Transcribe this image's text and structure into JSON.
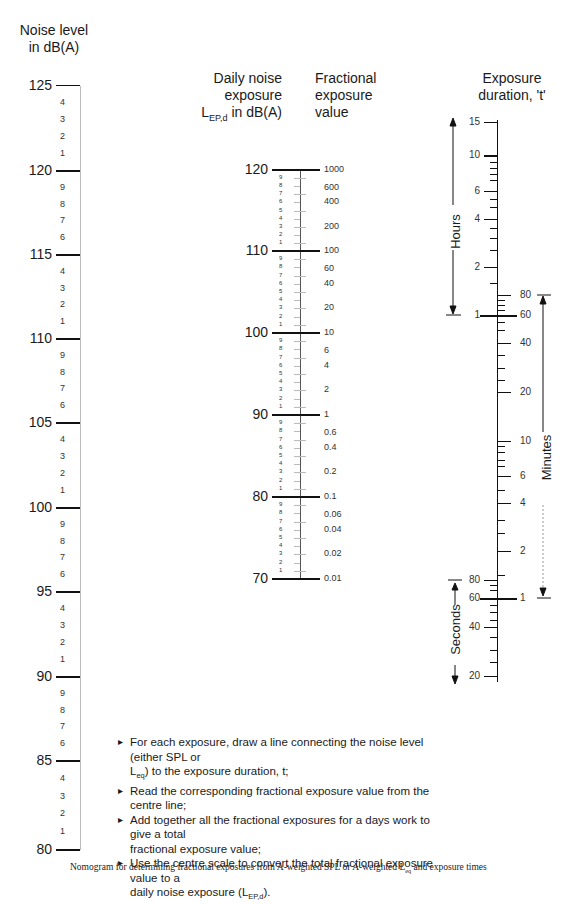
{
  "left_scale": {
    "title_line1": "Noise level",
    "title_line2": "in dB(A)",
    "major": [
      {
        "label": "125",
        "y": 86
      },
      {
        "label": "120",
        "y": 171
      },
      {
        "label": "115",
        "y": 255
      },
      {
        "label": "110",
        "y": 339
      },
      {
        "label": "105",
        "y": 423
      },
      {
        "label": "100",
        "y": 508
      },
      {
        "label": "95",
        "y": 592
      },
      {
        "label": "90",
        "y": 677
      },
      {
        "label": "85",
        "y": 761
      },
      {
        "label": "80",
        "y": 850
      }
    ],
    "minor_labels": [
      "4",
      "3",
      "2",
      "1",
      "9",
      "8",
      "7",
      "6"
    ]
  },
  "centre_scale": {
    "title_left_line1": "Daily noise",
    "title_left_line2": "exposure",
    "title_left_line3_main": "L",
    "title_left_line3_sub": "EP,d",
    "title_left_line3_rest": " in dB(A)",
    "title_right_line1": "Fractional",
    "title_right_line2": "exposure",
    "title_right_line3": "value",
    "major_left": [
      {
        "label": "120",
        "y": 170
      },
      {
        "label": "110",
        "y": 251
      },
      {
        "label": "100",
        "y": 333
      },
      {
        "label": "90",
        "y": 415
      },
      {
        "label": "80",
        "y": 497
      },
      {
        "label": "70",
        "y": 579
      }
    ],
    "right_values": [
      {
        "label": "1000",
        "y": 170
      },
      {
        "label": "600",
        "y": 188
      },
      {
        "label": "400",
        "y": 202
      },
      {
        "label": "200",
        "y": 227
      },
      {
        "label": "100",
        "y": 251
      },
      {
        "label": "60",
        "y": 269
      },
      {
        "label": "40",
        "y": 284
      },
      {
        "label": "20",
        "y": 308
      },
      {
        "label": "10",
        "y": 333
      },
      {
        "label": "6",
        "y": 351
      },
      {
        "label": "4",
        "y": 366
      },
      {
        "label": "2",
        "y": 390
      },
      {
        "label": "1",
        "y": 415
      },
      {
        "label": "0.6",
        "y": 433
      },
      {
        "label": "0.4",
        "y": 448
      },
      {
        "label": "0.2",
        "y": 472
      },
      {
        "label": "0.1",
        "y": 497
      },
      {
        "label": "0.06",
        "y": 515
      },
      {
        "label": "0.04",
        "y": 530
      },
      {
        "label": "0.02",
        "y": 554
      },
      {
        "label": "0.01",
        "y": 579
      }
    ],
    "minor_labels": [
      "9",
      "8",
      "7",
      "6",
      "5",
      "4",
      "3",
      "2",
      "1"
    ]
  },
  "right_scale": {
    "title_line1": "Exposure",
    "title_line2": "duration, 't'",
    "hours_label": "Hours",
    "minutes_label": "Minutes",
    "seconds_label": "Seconds",
    "hours": [
      {
        "label": "15",
        "y": 122
      },
      {
        "label": "10",
        "y": 155
      },
      {
        "label": "6",
        "y": 191
      },
      {
        "label": "4",
        "y": 219
      },
      {
        "label": "2",
        "y": 267
      },
      {
        "label": "1",
        "y": 315
      }
    ],
    "minutes": [
      {
        "label": "80",
        "y": 295
      },
      {
        "label": "60",
        "y": 315
      },
      {
        "label": "40",
        "y": 343
      },
      {
        "label": "20",
        "y": 392
      },
      {
        "label": "10",
        "y": 441
      },
      {
        "label": "6",
        "y": 476
      },
      {
        "label": "4",
        "y": 503
      },
      {
        "label": "2",
        "y": 551
      },
      {
        "label": "1",
        "y": 598
      }
    ],
    "seconds": [
      {
        "label": "80",
        "y": 580
      },
      {
        "label": "60",
        "y": 598
      },
      {
        "label": "40",
        "y": 627
      },
      {
        "label": "20",
        "y": 676
      }
    ]
  },
  "instructions": [
    {
      "text_a": "For each exposure, draw a line connecting the noise level (either SPL or",
      "text_b_main": "L",
      "text_b_sub": "eq",
      "text_b_rest": ") to the exposure duration, t;"
    },
    {
      "text_a": "Read the corresponding fractional exposure value  from the centre line;"
    },
    {
      "text_a": "Add together all the fractional exposures for a days work to give a total",
      "text_b_rest": "fractional exposure value;"
    },
    {
      "text_a": "Use the centre scale to convert the total fractional exposure value to a",
      "text_b_pre": "daily noise exposure (",
      "text_b_main": "L",
      "text_b_sub": "EP,d",
      "text_b_rest": ")."
    }
  ],
  "caption": {
    "pre": "Nomogram for determining fractional exposures from A-weighted SPL or A-weighted L",
    "sub": "eq",
    "post": " and exposure times"
  }
}
